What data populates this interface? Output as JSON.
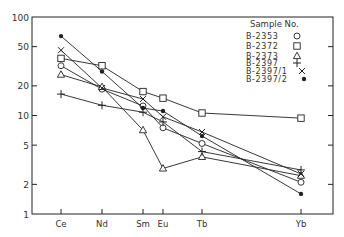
{
  "chart_data": {
    "type": "line",
    "title": "",
    "xlabel": "",
    "ylabel": "",
    "yscale": "log",
    "ylim": [
      1,
      100
    ],
    "yticks": [
      1,
      2,
      5,
      10,
      20,
      50,
      100
    ],
    "ytick_labels": [
      "1",
      "2",
      "5",
      "10",
      "20",
      "50",
      "100"
    ],
    "categories": [
      "Ce",
      "Nd",
      "Sm",
      "Eu",
      "Tb",
      "Yb"
    ],
    "category_positions": [
      61,
      102,
      143,
      163,
      202,
      301
    ],
    "legend_title": "Sample  No.",
    "legend_position": "top-right",
    "grid": false,
    "series": [
      {
        "name": "B-2353",
        "marker": "circle-open",
        "values": [
          32,
          18.5,
          12.5,
          7.5,
          5.2,
          2.1
        ]
      },
      {
        "name": "B-2372",
        "marker": "square-open",
        "values": [
          38,
          32,
          17.5,
          15,
          10.6,
          9.4
        ]
      },
      {
        "name": "B-2373",
        "marker": "triangle-open",
        "values": [
          26,
          19.5,
          7.1,
          2.9,
          3.8,
          2.45
        ]
      },
      {
        "name": "B-2397",
        "marker": "plus",
        "values": [
          16.5,
          12.7,
          10.8,
          8.6,
          4.3,
          2.8
        ]
      },
      {
        "name": "B-2397/1",
        "marker": "x",
        "values": [
          46,
          19,
          14.7,
          9.7,
          6.8,
          2.55
        ]
      },
      {
        "name": "B-2397/2",
        "marker": "dot-filled",
        "values": [
          64,
          28,
          11.9,
          11.1,
          6.2,
          1.6
        ]
      }
    ]
  }
}
